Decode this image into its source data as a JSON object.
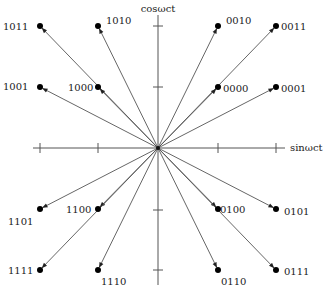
{
  "diagram": {
    "axes": {
      "x_label": "sinωct",
      "y_label": "cosωct",
      "origin": [
        158,
        148
      ],
      "x_range": [
        33,
        285
      ],
      "y_range": [
        15,
        285
      ],
      "x_ticks": [
        40,
        98,
        218,
        276
      ],
      "y_ticks": [
        26,
        87,
        210,
        270
      ]
    },
    "colors": {
      "axis": "#555555",
      "point": "#000000",
      "text": "#222222"
    },
    "points": [
      {
        "code": "1011",
        "x": 40,
        "y": 26,
        "lx": 3,
        "ly": 30,
        "anchor": "start"
      },
      {
        "code": "1010",
        "x": 98,
        "y": 26,
        "lx": 106,
        "ly": 24,
        "anchor": "start"
      },
      {
        "code": "0010",
        "x": 218,
        "y": 26,
        "lx": 226,
        "ly": 24,
        "anchor": "start"
      },
      {
        "code": "0011",
        "x": 276,
        "y": 26,
        "lx": 281,
        "ly": 30,
        "anchor": "start"
      },
      {
        "code": "1001",
        "x": 40,
        "y": 87,
        "lx": 3,
        "ly": 90,
        "anchor": "start"
      },
      {
        "code": "1000",
        "x": 98,
        "y": 87,
        "lx": 68,
        "ly": 91,
        "anchor": "start"
      },
      {
        "code": "0000",
        "x": 218,
        "y": 87,
        "lx": 223,
        "ly": 92,
        "anchor": "start"
      },
      {
        "code": "0001",
        "x": 276,
        "y": 87,
        "lx": 281,
        "ly": 92,
        "anchor": "start"
      },
      {
        "code": "1101",
        "x": 40,
        "y": 209,
        "lx": 8,
        "ly": 225,
        "anchor": "start"
      },
      {
        "code": "1100",
        "x": 98,
        "y": 209,
        "lx": 66,
        "ly": 213,
        "anchor": "start"
      },
      {
        "code": "0100",
        "x": 218,
        "y": 209,
        "lx": 220,
        "ly": 213,
        "anchor": "start"
      },
      {
        "code": "0101",
        "x": 276,
        "y": 209,
        "lx": 284,
        "ly": 215,
        "anchor": "start"
      },
      {
        "code": "1111",
        "x": 40,
        "y": 270,
        "lx": 8,
        "ly": 274,
        "anchor": "start"
      },
      {
        "code": "1110",
        "x": 98,
        "y": 270,
        "lx": 101,
        "ly": 285,
        "anchor": "start"
      },
      {
        "code": "0110",
        "x": 218,
        "y": 270,
        "lx": 221,
        "ly": 285,
        "anchor": "start"
      },
      {
        "code": "0111",
        "x": 276,
        "y": 270,
        "lx": 284,
        "ly": 275,
        "anchor": "start"
      }
    ]
  }
}
